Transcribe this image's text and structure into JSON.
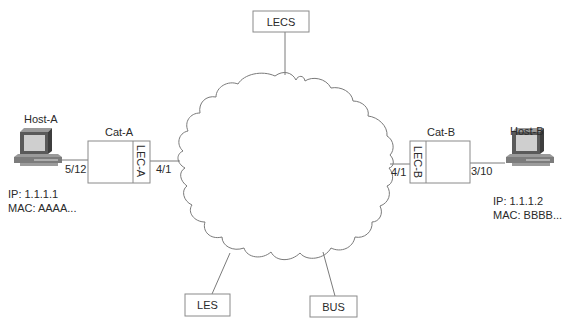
{
  "diagram": {
    "type": "network-topology",
    "cloud": {
      "label": ""
    },
    "servers": {
      "lecs": {
        "label": "LECS"
      },
      "les": {
        "label": "LES"
      },
      "bus": {
        "label": "BUS"
      }
    },
    "switches": [
      {
        "name": "Cat-A",
        "lec_label": "LEC-A",
        "host_port": "5/12",
        "atm_port": "4/1"
      },
      {
        "name": "Cat-B",
        "lec_label": "LEC-B",
        "host_port": "3/10",
        "atm_port": "4/1"
      }
    ],
    "hosts": [
      {
        "name": "Host-A",
        "ip": "IP: 1.1.1.1",
        "mac": "MAC: AAAA..."
      },
      {
        "name": "Host-B",
        "ip": "IP: 1.1.1.2",
        "mac": "MAC: BBBB..."
      }
    ],
    "colors": {
      "line": "#7a7a7a",
      "box_border": "#8a8a8a",
      "text": "#2a2a2a",
      "pc_dark": "#4a4a4a",
      "pc_mid": "#8c8c8c",
      "pc_screen": "#c8c8c8"
    }
  }
}
